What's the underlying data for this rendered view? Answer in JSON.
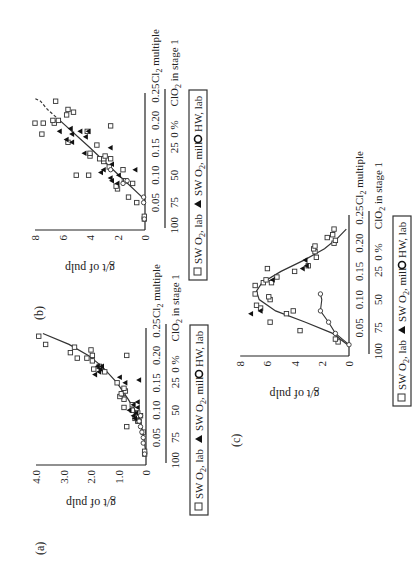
{
  "figure": {
    "panel_labels": [
      "(a)",
      "(b)",
      "(c)"
    ]
  },
  "chart_data": [
    {
      "panel": "(a)",
      "type": "scatter",
      "title": "",
      "xlabel": "Cl2 multiple",
      "xlabel_secondary": "% ClO2 in stage 1",
      "ylabel": "g/t of pulp",
      "xlim": [
        0,
        0.25
      ],
      "ylim": [
        0,
        4.0
      ],
      "xticks": [
        "0.05",
        "0.10",
        "0.15",
        "0.20",
        "0.25"
      ],
      "xticks_secondary": [
        "100",
        "75",
        "50",
        "25",
        "0"
      ],
      "yticks": [
        "0",
        "1.0",
        "2.0",
        "3.0",
        "4.0"
      ],
      "legend": [
        "SW O2, lab",
        "SW O2, mill",
        "HW, lab"
      ],
      "fit_curve": [
        [
          0.02,
          0.0
        ],
        [
          0.05,
          0.08
        ],
        [
          0.08,
          0.2
        ],
        [
          0.1,
          0.4
        ],
        [
          0.12,
          0.65
        ],
        [
          0.15,
          1.05
        ],
        [
          0.18,
          1.6
        ],
        [
          0.2,
          2.1
        ],
        [
          0.22,
          2.8
        ],
        [
          0.24,
          3.75
        ]
      ],
      "series": [
        {
          "name": "SW O2, lab",
          "marker": "open-square",
          "points": [
            [
              0.02,
              0.05
            ],
            [
              0.025,
              0.05
            ],
            [
              0.06,
              0.1
            ],
            [
              0.07,
              0.7
            ],
            [
              0.08,
              0.3
            ],
            [
              0.08,
              0.25
            ],
            [
              0.085,
              0.4
            ],
            [
              0.09,
              0.2
            ],
            [
              0.09,
              0.35
            ],
            [
              0.095,
              0.3
            ],
            [
              0.1,
              0.5
            ],
            [
              0.105,
              0.8
            ],
            [
              0.11,
              0.5
            ],
            [
              0.12,
              0.8
            ],
            [
              0.125,
              0.95
            ],
            [
              0.13,
              0.85
            ],
            [
              0.13,
              0.9
            ],
            [
              0.135,
              0.75
            ],
            [
              0.14,
              0.8
            ],
            [
              0.15,
              1.05
            ],
            [
              0.17,
              1.5
            ],
            [
              0.175,
              1.9
            ],
            [
              0.18,
              1.7
            ],
            [
              0.19,
              1.95
            ],
            [
              0.195,
              2.5
            ],
            [
              0.195,
              2.15
            ],
            [
              0.2,
              0.7
            ],
            [
              0.2,
              1.95
            ],
            [
              0.205,
              2.75
            ],
            [
              0.21,
              2.0
            ],
            [
              0.215,
              2.6
            ],
            [
              0.22,
              3.65
            ],
            [
              0.235,
              3.9
            ]
          ]
        },
        {
          "name": "SW O2, mill",
          "marker": "filled-triangle",
          "points": [
            [
              0.085,
              0.4
            ],
            [
              0.09,
              0.45
            ],
            [
              0.095,
              0.35
            ],
            [
              0.1,
              0.6
            ],
            [
              0.105,
              0.3
            ],
            [
              0.11,
              0.45
            ],
            [
              0.115,
              0.3
            ],
            [
              0.155,
              0.25
            ],
            [
              0.15,
              0.75
            ],
            [
              0.16,
              0.95
            ],
            [
              0.165,
              1.85
            ],
            [
              0.17,
              1.7
            ],
            [
              0.175,
              1.65
            ],
            [
              0.18,
              1.75
            ],
            [
              0.18,
              1.6
            ]
          ]
        },
        {
          "name": "HW, lab",
          "marker": "open-circle",
          "points": [
            [
              0.02,
              0.05
            ],
            [
              0.04,
              0.1
            ],
            [
              0.05,
              0.1
            ],
            [
              0.06,
              0.15
            ],
            [
              0.07,
              0.2
            ],
            [
              0.08,
              0.25
            ],
            [
              0.09,
              0.2
            ]
          ]
        }
      ]
    },
    {
      "panel": "(b)",
      "type": "scatter",
      "title": "",
      "xlabel": "Cl2 multiple",
      "xlabel_secondary": "% ClO2 in stage 1",
      "ylabel": "g/t of pulp",
      "xlim": [
        0,
        0.25
      ],
      "ylim": [
        0,
        8
      ],
      "xticks": [
        "0.05",
        "0.10",
        "0.15",
        "0.20",
        "0.25"
      ],
      "xticks_secondary": [
        "100",
        "75",
        "50",
        "25",
        "0"
      ],
      "yticks": [
        "0",
        "2",
        "4",
        "6",
        "8"
      ],
      "legend": [
        "SW O2, lab",
        "SW O2, mill",
        "HW, lab"
      ],
      "fit_curve": [
        [
          0.055,
          0.0
        ],
        [
          0.1,
          1.9
        ],
        [
          0.15,
          4.0
        ],
        [
          0.2,
          6.2
        ]
      ],
      "fit_curve_dashed": [
        [
          0.2,
          6.2
        ],
        [
          0.22,
          7.1
        ],
        [
          0.235,
          7.6
        ],
        [
          0.24,
          8.0
        ]
      ],
      "series": [
        {
          "name": "SW O2, lab",
          "marker": "open-square",
          "points": [
            [
              0.02,
              0.05
            ],
            [
              0.025,
              0.05
            ],
            [
              0.05,
              0.6
            ],
            [
              0.06,
              1.2
            ],
            [
              0.075,
              2.0
            ],
            [
              0.08,
              2.1
            ],
            [
              0.085,
              0.9
            ],
            [
              0.09,
              1.5
            ],
            [
              0.09,
              1.4
            ],
            [
              0.1,
              5.0
            ],
            [
              0.1,
              4.1
            ],
            [
              0.11,
              1.6
            ],
            [
              0.115,
              2.6
            ],
            [
              0.125,
              3.0
            ],
            [
              0.13,
              3.3
            ],
            [
              0.13,
              2.5
            ],
            [
              0.13,
              3.0
            ],
            [
              0.135,
              2.9
            ],
            [
              0.135,
              4.0
            ],
            [
              0.14,
              4.0
            ],
            [
              0.155,
              3.5
            ],
            [
              0.16,
              5.6
            ],
            [
              0.175,
              7.5
            ],
            [
              0.18,
              4.2
            ],
            [
              0.19,
              2.5
            ],
            [
              0.195,
              8.0
            ],
            [
              0.195,
              7.4
            ],
            [
              0.195,
              6.6
            ],
            [
              0.2,
              6.3
            ],
            [
              0.2,
              6.7
            ],
            [
              0.21,
              5.7
            ],
            [
              0.215,
              5.2
            ],
            [
              0.22,
              5.6
            ],
            [
              0.235,
              6.5
            ]
          ]
        },
        {
          "name": "SW O2, mill",
          "marker": "filled-triangle",
          "points": [
            [
              0.085,
              2.0
            ],
            [
              0.09,
              2.4
            ],
            [
              0.095,
              2.5
            ],
            [
              0.1,
              1.9
            ],
            [
              0.105,
              3.2
            ],
            [
              0.11,
              3.0
            ],
            [
              0.11,
              0.7
            ],
            [
              0.12,
              2.4
            ],
            [
              0.14,
              4.4
            ],
            [
              0.15,
              2.5
            ],
            [
              0.16,
              5.3
            ],
            [
              0.165,
              5.7
            ],
            [
              0.17,
              4.3
            ],
            [
              0.175,
              5.3
            ],
            [
              0.18,
              6.2
            ],
            [
              0.18,
              4.7
            ],
            [
              0.185,
              5.4
            ],
            [
              0.18,
              4.1
            ]
          ]
        },
        {
          "name": "HW, lab",
          "marker": "open-circle",
          "points": [
            [
              0.02,
              0.05
            ],
            [
              0.05,
              0.1
            ],
            [
              0.06,
              0.1
            ],
            [
              0.085,
              1.6
            ],
            [
              0.09,
              1.3
            ],
            [
              0.11,
              2.5
            ]
          ]
        }
      ]
    },
    {
      "panel": "(c)",
      "type": "scatter",
      "title": "",
      "xlabel": "Cl2 multiple",
      "xlabel_secondary": "% ClO2 in stage 1",
      "ylabel": "g/t of pulp",
      "xlim": [
        0,
        0.25
      ],
      "ylim": [
        0,
        8
      ],
      "xticks": [
        "0.05",
        "0.10",
        "0.15",
        "0.20",
        "0.25"
      ],
      "xticks_secondary": [
        "100",
        "75",
        "50",
        "25",
        "0"
      ],
      "yticks": [
        "0",
        "2",
        "4",
        "6",
        "8"
      ],
      "legend": [
        "SW O2, lab",
        "SW O2, mill",
        "HW, lab"
      ],
      "fit_curve": [
        [
          0.02,
          0.1
        ],
        [
          0.04,
          1.2
        ],
        [
          0.06,
          3.2
        ],
        [
          0.08,
          5.4
        ],
        [
          0.1,
          6.6
        ],
        [
          0.115,
          6.8
        ],
        [
          0.13,
          6.4
        ],
        [
          0.15,
          5.0
        ],
        [
          0.17,
          3.3
        ],
        [
          0.19,
          1.8
        ],
        [
          0.21,
          0.8
        ],
        [
          0.225,
          0.2
        ]
      ],
      "hw_curve": [
        [
          0.02,
          0.0
        ],
        [
          0.04,
          1.0
        ],
        [
          0.06,
          1.5
        ],
        [
          0.08,
          2.1
        ],
        [
          0.1,
          2.0
        ],
        [
          0.11,
          2.1
        ]
      ],
      "series": [
        {
          "name": "SW O2, lab",
          "marker": "open-square",
          "points": [
            [
              0.025,
              0.8
            ],
            [
              0.03,
              1.0
            ],
            [
              0.045,
              3.6
            ],
            [
              0.06,
              5.8
            ],
            [
              0.075,
              4.6
            ],
            [
              0.08,
              4.1
            ],
            [
              0.085,
              6.5
            ],
            [
              0.09,
              6.8
            ],
            [
              0.1,
              5.8
            ],
            [
              0.105,
              5.9
            ],
            [
              0.11,
              6.9
            ],
            [
              0.125,
              6.9
            ],
            [
              0.13,
              6.3
            ],
            [
              0.13,
              5.7
            ],
            [
              0.135,
              6.1
            ],
            [
              0.14,
              5.3
            ],
            [
              0.15,
              4.0
            ],
            [
              0.155,
              6.0
            ],
            [
              0.16,
              3.0
            ],
            [
              0.175,
              2.4
            ],
            [
              0.185,
              2.5
            ],
            [
              0.19,
              2.6
            ],
            [
              0.195,
              2.5
            ],
            [
              0.2,
              1.1
            ],
            [
              0.205,
              1.0
            ],
            [
              0.21,
              1.6
            ],
            [
              0.215,
              1.2
            ],
            [
              0.225,
              1.1
            ]
          ]
        },
        {
          "name": "SW O2, mill",
          "marker": "filled-triangle",
          "points": [
            [
              0.075,
              7.2
            ],
            [
              0.08,
              6.5
            ],
            [
              0.135,
              5.6
            ],
            [
              0.155,
              3.4
            ],
            [
              0.16,
              3.1
            ],
            [
              0.17,
              3.2
            ]
          ]
        },
        {
          "name": "HW, lab",
          "marker": "open-circle",
          "points": [
            [
              0.02,
              0.0
            ],
            [
              0.04,
              1.0
            ],
            [
              0.06,
              1.5
            ],
            [
              0.08,
              2.1
            ],
            [
              0.11,
              2.1
            ]
          ]
        }
      ]
    }
  ],
  "layout_panels": [
    {
      "origin": [
        104,
        146
      ],
      "xscale": 548,
      "yscale": 27.5,
      "label_pos": [
        14,
        36
      ]
    },
    {
      "origin": [
        339,
        145
      ],
      "xscale": 548,
      "yscale": 13.75,
      "label_pos": [
        249,
        35
      ]
    },
    {
      "origin": [
        213,
        349
      ],
      "xscale": 564,
      "yscale": 13.6,
      "label_pos": [
        122,
        232
      ]
    }
  ]
}
